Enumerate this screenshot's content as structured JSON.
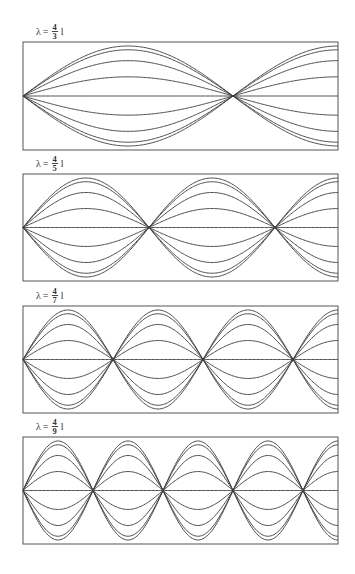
{
  "figure": {
    "line_color": "#3a3a3a",
    "frame_color": "#555555"
  },
  "panels": [
    {
      "label": {
        "lambda": "λ",
        "eq": "=",
        "num": "4",
        "den": "3",
        "unit": "l"
      },
      "n": 3,
      "box": {
        "x": 23,
        "y": 42,
        "w": 315,
        "h": 108
      }
    },
    {
      "label": {
        "lambda": "λ",
        "eq": "=",
        "num": "4",
        "den": "5",
        "unit": "l"
      },
      "n": 5,
      "box": {
        "x": 23,
        "y": 174,
        "w": 315,
        "h": 107
      }
    },
    {
      "label": {
        "lambda": "λ",
        "eq": "=",
        "num": "4",
        "den": "7",
        "unit": "l"
      },
      "n": 7,
      "box": {
        "x": 23,
        "y": 306,
        "w": 315,
        "h": 107
      }
    },
    {
      "label": {
        "lambda": "λ",
        "eq": "=",
        "num": "4",
        "den": "9",
        "unit": "l"
      },
      "n": 9,
      "box": {
        "x": 23,
        "y": 437,
        "w": 315,
        "h": 107
      }
    }
  ],
  "chart_data": {
    "type": "line",
    "panels": [
      {
        "label": "λ = 4/3 l",
        "wavelength_over_l": 1.3333,
        "half_wavelengths_in_frame": 1.5,
        "node_positions_over_l": [
          0,
          0.667
        ]
      },
      {
        "label": "λ = 4/5 l",
        "wavelength_over_l": 0.8,
        "half_wavelengths_in_frame": 2.5,
        "node_positions_over_l": [
          0,
          0.4,
          0.8
        ]
      },
      {
        "label": "λ = 4/7 l",
        "wavelength_over_l": 0.5714,
        "half_wavelengths_in_frame": 3.5,
        "node_positions_over_l": [
          0,
          0.286,
          0.571,
          0.857
        ]
      },
      {
        "label": "λ = 4/9 l",
        "wavelength_over_l": 0.4444,
        "half_wavelengths_in_frame": 4.5,
        "node_positions_over_l": [
          0,
          0.222,
          0.444,
          0.667,
          0.889
        ]
      }
    ],
    "amplitude_snapshots": [
      1.0,
      0.924,
      0.707,
      0.383,
      0.0,
      -0.383,
      -0.707,
      -0.924,
      -1.0
    ],
    "xlabel": "",
    "ylabel": "",
    "grid": false,
    "legend": "none"
  }
}
